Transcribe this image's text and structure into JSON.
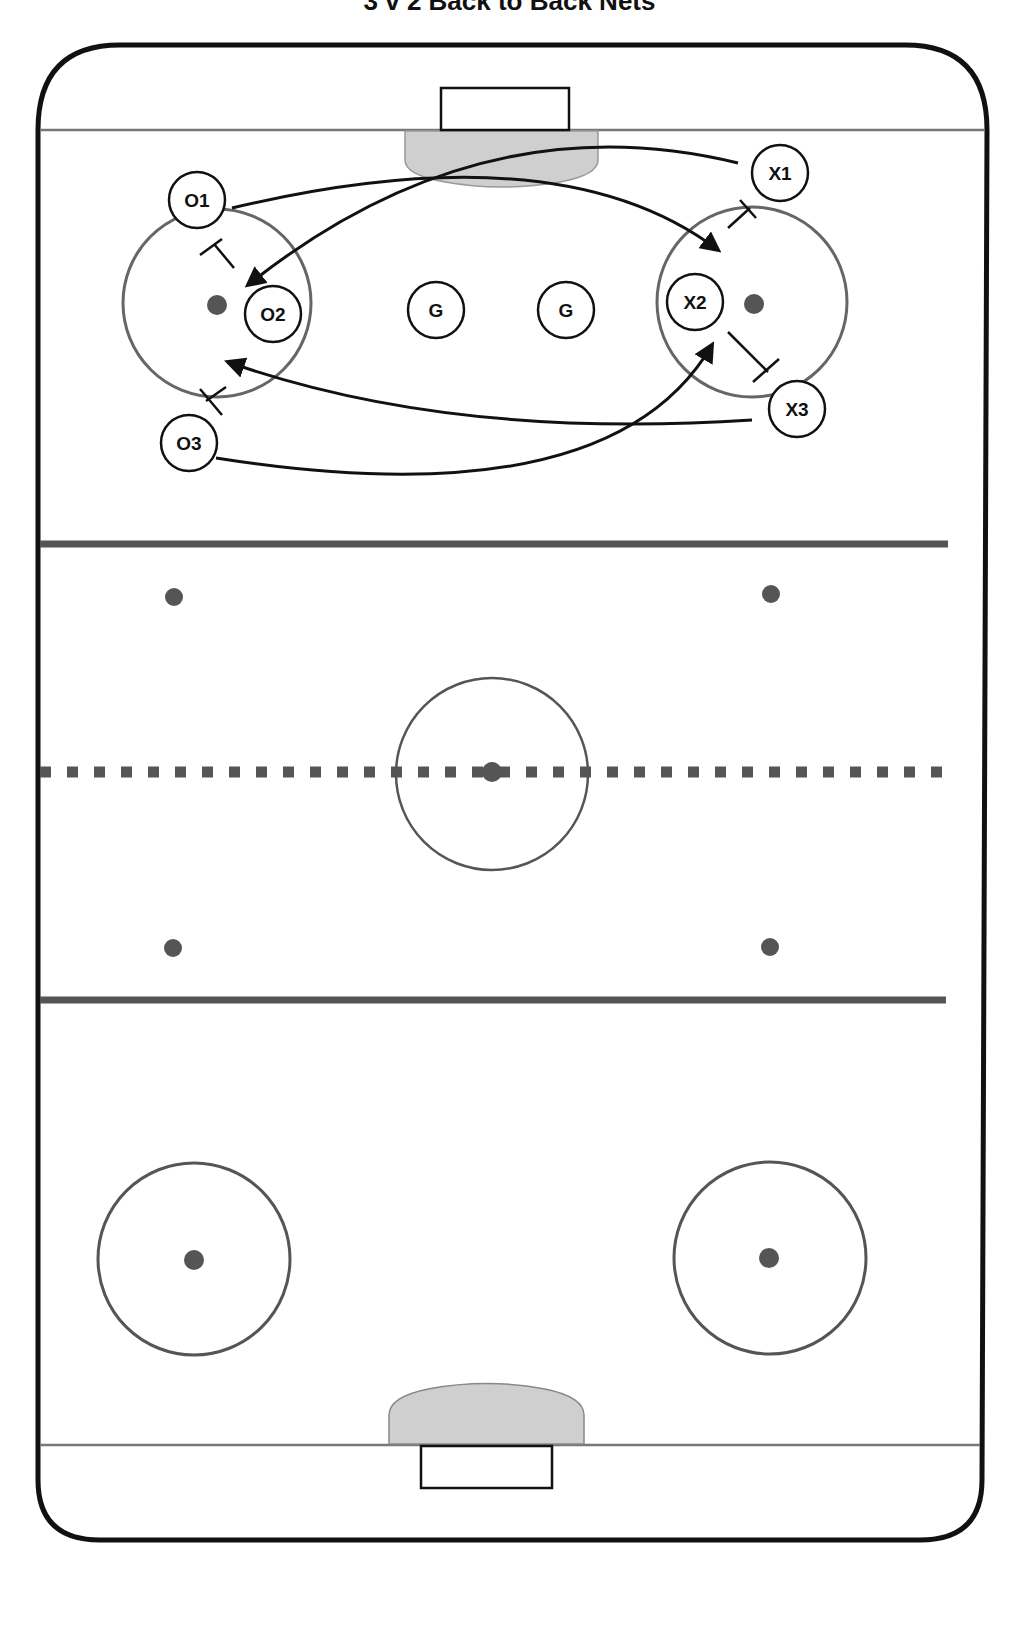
{
  "title": "3 v 2 Back to Back Nets",
  "colors": {
    "boards": "#111111",
    "lines": "#555555",
    "goal_line": "#777777",
    "crease": "#cfcfcf",
    "dots": "#555555",
    "player_stroke": "#111111",
    "arrow": "#111111"
  },
  "players": {
    "o1": "O1",
    "o2": "O2",
    "o3": "O3",
    "x1": "X1",
    "x2": "X2",
    "x3": "X3",
    "g1": "G",
    "g2": "G"
  }
}
